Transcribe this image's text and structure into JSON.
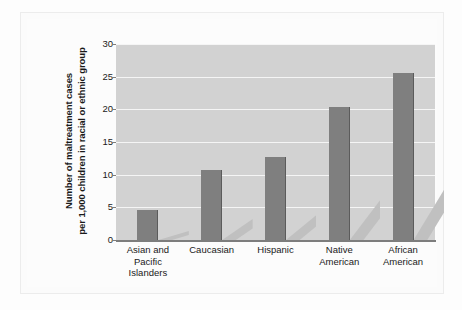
{
  "chart_data": {
    "type": "bar",
    "title": "",
    "xlabel": "",
    "ylabel_lines": [
      "Number of maltreatment cases",
      "per 1,000 children in racial or ethnic group"
    ],
    "categories": [
      "Asian and Pacific Islanders",
      "Caucasian",
      "Hispanic",
      "Native American",
      "African American"
    ],
    "category_lines": [
      [
        "Asian and",
        "Pacific",
        "Islanders"
      ],
      [
        "Caucasian"
      ],
      [
        "Hispanic"
      ],
      [
        "Native",
        "American"
      ],
      [
        "African",
        "American"
      ]
    ],
    "values": [
      4.6,
      10.7,
      12.7,
      20.4,
      25.6
    ],
    "ylim": [
      0,
      30
    ],
    "yticks": [
      0,
      5,
      10,
      15,
      20,
      25,
      30
    ],
    "ytick_labels": [
      "0",
      "5",
      "10",
      "15",
      "20",
      "25",
      "30"
    ],
    "grid": true,
    "legend": false,
    "colors": {
      "bar": "#7f7f7f",
      "bar_edge": "#5b5b5b",
      "bar_shadow": "#c0c0c0",
      "plot_background": "#d2d2d2",
      "gridline": "#f5f5f5",
      "axis": "#7d7d7d",
      "text": "#1a1a1a",
      "page_background": "#fdfdfd"
    }
  }
}
